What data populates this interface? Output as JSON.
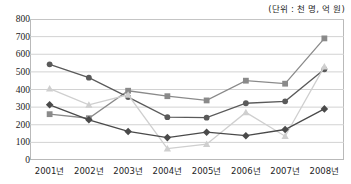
{
  "unit_note": "(단위 : 천 명, 억 원)",
  "axis": {
    "y_ticks": [
      "800",
      "700",
      "600",
      "500",
      "400",
      "300",
      "200",
      "100",
      "0"
    ],
    "x_ticks": [
      "2001년",
      "2002년",
      "2003년",
      "2004년",
      "2005년",
      "2006년",
      "2007년",
      "2008년"
    ]
  },
  "colors": {
    "series_circle": "#5a5a5a",
    "series_square": "#8a8a8a",
    "series_triangle": "#cfcfcf",
    "series_diamond": "#4a4a4a",
    "grid": "#d2d2d2",
    "frame": "#b9b9b9",
    "text": "#1c1c1c"
  },
  "chart_data": {
    "type": "line",
    "title": "",
    "subtitle": "",
    "xlabel": "",
    "ylabel": "",
    "unit_note": "(단위 : 천 명, 억 원)",
    "categories": [
      "2001년",
      "2002년",
      "2003년",
      "2004년",
      "2005년",
      "2006년",
      "2007년",
      "2008년"
    ],
    "ylim": [
      0,
      800
    ],
    "ytick_step": 100,
    "grid": true,
    "legend": "none",
    "series": [
      {
        "name": "series-square",
        "marker": "square",
        "color": "#8a8a8a",
        "values": [
          260,
          237,
          393,
          362,
          338,
          450,
          433,
          690
        ]
      },
      {
        "name": "series-circle",
        "marker": "circle",
        "color": "#5a5a5a",
        "values": [
          543,
          467,
          357,
          243,
          240,
          322,
          333,
          515
        ]
      },
      {
        "name": "series-triangle",
        "marker": "triangle",
        "color": "#cfcfcf",
        "values": [
          405,
          313,
          370,
          65,
          90,
          270,
          135,
          530
        ]
      },
      {
        "name": "series-diamond",
        "marker": "diamond",
        "color": "#4a4a4a",
        "values": [
          313,
          228,
          162,
          127,
          158,
          138,
          173,
          290
        ]
      }
    ]
  }
}
